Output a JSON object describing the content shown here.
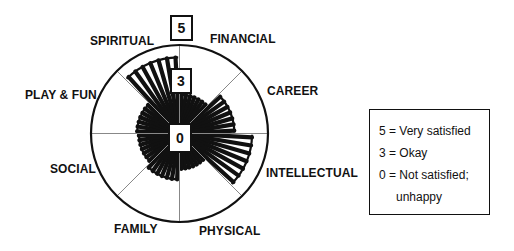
{
  "chart_data": {
    "type": "radial-bar",
    "scale": {
      "min": 0,
      "max": 5
    },
    "categories": [
      "FINANCIAL",
      "CAREER",
      "INTELLECTUAL",
      "PHYSICAL",
      "FAMILY",
      "SOCIAL",
      "PLAY & FUN",
      "SPIRITUAL"
    ],
    "values": [
      2.2,
      3.1,
      4.1,
      2.0,
      2.6,
      2.3,
      2.4,
      4.3
    ]
  },
  "scale_markers": {
    "outer": "5",
    "middle": "3",
    "center": "0"
  },
  "labels": {
    "financial": "FINANCIAL",
    "career": "CAREER",
    "intellectual": "INTELLECTUAL",
    "physical": "PHYSICAL",
    "family": "FAMILY",
    "social": "SOCIAL",
    "play_fun": "PLAY & FUN",
    "spiritual": "SPIRITUAL"
  },
  "legend": {
    "line1": "5 = Very satisfied",
    "line2": "3 = Okay",
    "line3": "0 = Not satisfied;",
    "line4": "unhappy"
  },
  "colors": {
    "ink": "#111111",
    "divider": "#888888",
    "background": "#ffffff"
  }
}
